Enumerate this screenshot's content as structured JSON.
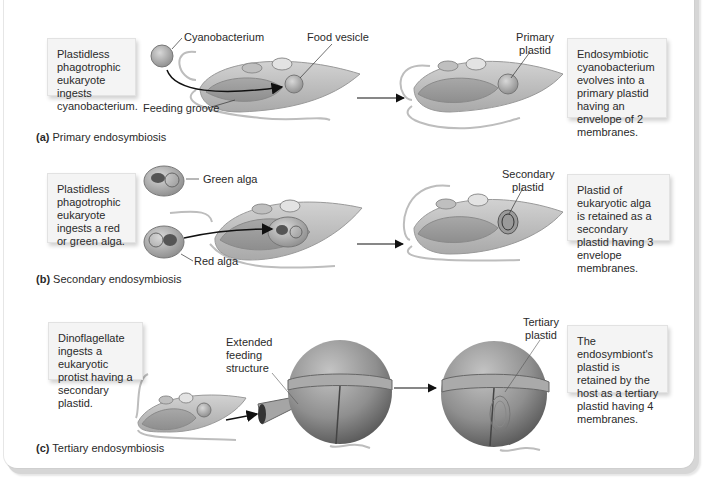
{
  "panels": [
    {
      "id": "a",
      "caption_letter": "(a)",
      "caption_text": "Primary endosymbiosis",
      "left_box": "Plastidless phagotrophic eukaryote ingests cyanobacterium.",
      "right_box": "Endosymbiotic cyanobacterium evolves into a primary plastid having an envelope of 2 membranes.",
      "labels": {
        "cyanobacterium": "Cyanobacterium",
        "food_vesicle": "Food vesicle",
        "feeding_groove": "Feeding groove",
        "primary_plastid_1": "Primary",
        "primary_plastid_2": "plastid"
      }
    },
    {
      "id": "b",
      "caption_letter": "(b)",
      "caption_text": "Secondary endosymbiosis",
      "left_box": "Plastidless phagotrophic eukaryote ingests a red or green alga.",
      "right_box": "Plastid of eukaryotic alga is retained as a secondary plastid having 3 envelope membranes.",
      "labels": {
        "green_alga": "Green alga",
        "red_alga": "Red alga",
        "secondary_plastid_1": "Secondary",
        "secondary_plastid_2": "plastid"
      }
    },
    {
      "id": "c",
      "caption_letter": "(c)",
      "caption_text": "Tertiary endosymbiosis",
      "left_box": "Dinoflagellate ingests a eukaryotic protist having a secondary plastid.",
      "right_box": "The endosymbiont's plastid is retained by the host as a tertiary plastid having 4 membranes.",
      "labels": {
        "extended_1": "Extended",
        "extended_2": "feeding",
        "extended_3": "structure",
        "tertiary_plastid_1": "Tertiary",
        "tertiary_plastid_2": "plastid"
      }
    }
  ],
  "colors": {
    "cell_fill": "#bdbdbd",
    "cell_edge": "#8a8a8a",
    "box_fill": "#f4f4f4",
    "text": "#2a2a2a"
  }
}
